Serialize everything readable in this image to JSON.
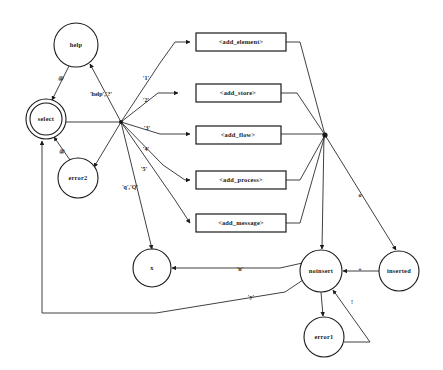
{
  "diagram": {
    "type": "finite-state-machine",
    "background_color": "#ffffff",
    "stroke_color": "#1a1a1a",
    "states": [
      {
        "id": "help",
        "label": "help",
        "shape": "circle",
        "cx": 76,
        "cy": 45,
        "r": 22
      },
      {
        "id": "select",
        "label": "select",
        "shape": "double-circle",
        "cx": 46,
        "cy": 119,
        "r": 20,
        "r_inner": 16
      },
      {
        "id": "error2",
        "label": "error2",
        "shape": "circle",
        "cx": 78,
        "cy": 178,
        "r": 20
      },
      {
        "id": "x",
        "label": "x",
        "shape": "circle",
        "cx": 152,
        "cy": 268,
        "r": 19
      },
      {
        "id": "noinsert",
        "label": "noinsert",
        "shape": "circle",
        "cx": 321,
        "cy": 271,
        "r": 21
      },
      {
        "id": "inserted",
        "label": "inserted",
        "shape": "circle",
        "cx": 399,
        "cy": 271,
        "r": 20
      },
      {
        "id": "error1",
        "label": "error1",
        "shape": "circle",
        "cx": 324,
        "cy": 337,
        "r": 20
      }
    ],
    "action_boxes": [
      {
        "id": "add_element",
        "label": "<add_element>",
        "x": 196,
        "y": 33,
        "w": 90,
        "h": 18
      },
      {
        "id": "add_store",
        "label": "<add_store>",
        "x": 196,
        "y": 84,
        "w": 85,
        "h": 18
      },
      {
        "id": "add_flow",
        "label": "<add_flow>",
        "x": 196,
        "y": 126,
        "w": 85,
        "h": 18
      },
      {
        "id": "add_process",
        "label": "<add_process>",
        "x": 196,
        "y": 171,
        "w": 90,
        "h": 18
      },
      {
        "id": "add_message",
        "label": "<add_message>",
        "x": 196,
        "y": 214,
        "w": 90,
        "h": 18
      }
    ],
    "hubs": [
      {
        "id": "left-hub",
        "cx": 121,
        "cy": 122
      },
      {
        "id": "right-hub",
        "cx": 325,
        "cy": 135
      }
    ],
    "edge_labels": [
      {
        "id": "help-to-select",
        "text": "@",
        "x": 61,
        "y": 79
      },
      {
        "id": "error2-to-select",
        "text": "@",
        "x": 62,
        "y": 152
      },
      {
        "id": "hub-to-help",
        "text": "'help','?'",
        "x": 101,
        "y": 95
      },
      {
        "id": "hub-to-add-element",
        "text": "'1'",
        "x": 146,
        "y": 79
      },
      {
        "id": "hub-to-add-store",
        "text": "'2'",
        "x": 146,
        "y": 101
      },
      {
        "id": "hub-to-add-flow",
        "text": "'3'",
        "x": 147,
        "y": 129
      },
      {
        "id": "hub-to-add-process",
        "text": "'4'",
        "x": 146,
        "y": 150
      },
      {
        "id": "hub-to-add-message",
        "text": "'5'",
        "x": 144,
        "y": 170
      },
      {
        "id": "hub-to-x",
        "text": "'q','Q'",
        "x": 130,
        "y": 188
      },
      {
        "id": "right-hub-to-inserted",
        "text": "o",
        "x": 360,
        "y": 196
      },
      {
        "id": "noinsert-to-inserted",
        "text": "+",
        "x": 360,
        "y": 271
      },
      {
        "id": "error1-to-noinsert",
        "text": "!",
        "x": 352,
        "y": 303
      },
      {
        "id": "noinsert-to-x",
        "text": "'n'",
        "x": 240,
        "y": 270
      },
      {
        "id": "return-to-select",
        "text": "'y'",
        "x": 251,
        "y": 298
      }
    ]
  }
}
